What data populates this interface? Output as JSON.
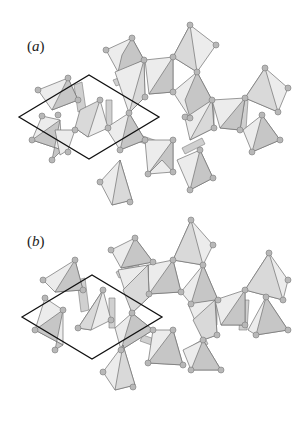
{
  "figure": {
    "panels": [
      {
        "id": "a",
        "label_prefix": "(",
        "label_letter": "a",
        "label_suffix": ")",
        "unit_cell": {
          "left": [
            19,
            117
          ],
          "top": [
            89,
            75
          ],
          "right": [
            159,
            117
          ],
          "bottom": [
            89,
            159
          ]
        }
      },
      {
        "id": "b",
        "label_prefix": "(",
        "label_letter": "b",
        "label_suffix": ")",
        "unit_cell": {
          "left": [
            22,
            117
          ],
          "top": [
            92,
            75
          ],
          "right": [
            162,
            117
          ],
          "bottom": [
            92,
            159
          ]
        }
      }
    ],
    "colors": {
      "face_light": "#ececec",
      "face_mid": "#d9d9d9",
      "face_dark": "#c6c6c6",
      "atom": "#b8b8b8",
      "edge": "#707070",
      "cell_outline": "#111111"
    }
  }
}
